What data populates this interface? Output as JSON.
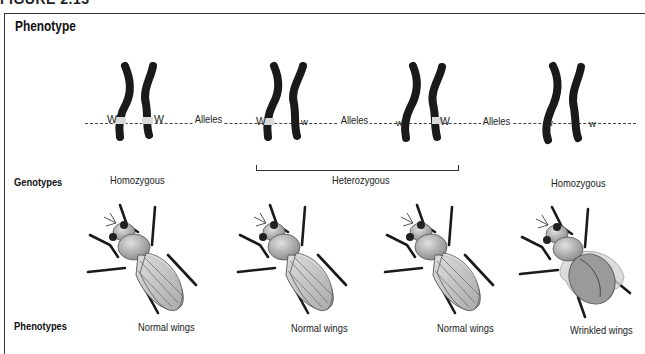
{
  "figure_header": "FIGURE 2.13",
  "title": "Phenotype",
  "row_labels": {
    "genotypes": "Genotypes",
    "phenotypes": "Phenotypes"
  },
  "alleles_label": "Alleles",
  "chromosome_pairs": [
    {
      "left_allele": "W",
      "right_allele": "W",
      "genotype": "Homozygous",
      "phenotype": "Normal wings"
    },
    {
      "left_allele": "W",
      "right_allele": "w",
      "genotype": "Heterozygous",
      "phenotype": "Normal wings"
    },
    {
      "left_allele": "w",
      "right_allele": "W",
      "genotype": "Heterozygous",
      "phenotype": "Normal wings"
    },
    {
      "left_allele": "w",
      "right_allele": "w",
      "genotype": "Homozygous",
      "phenotype": "Wrinkled wings"
    }
  ],
  "genotype_labels": {
    "left_homozygous": "Homozygous",
    "heterozygous": "Heterozygous",
    "right_homozygous": "Homozygous"
  },
  "colors": {
    "chromosome": "#1a1a1a",
    "allele_band": "#d9d9d9",
    "fly_body": "#9a9a9a",
    "wing": "#c8c8c8"
  }
}
